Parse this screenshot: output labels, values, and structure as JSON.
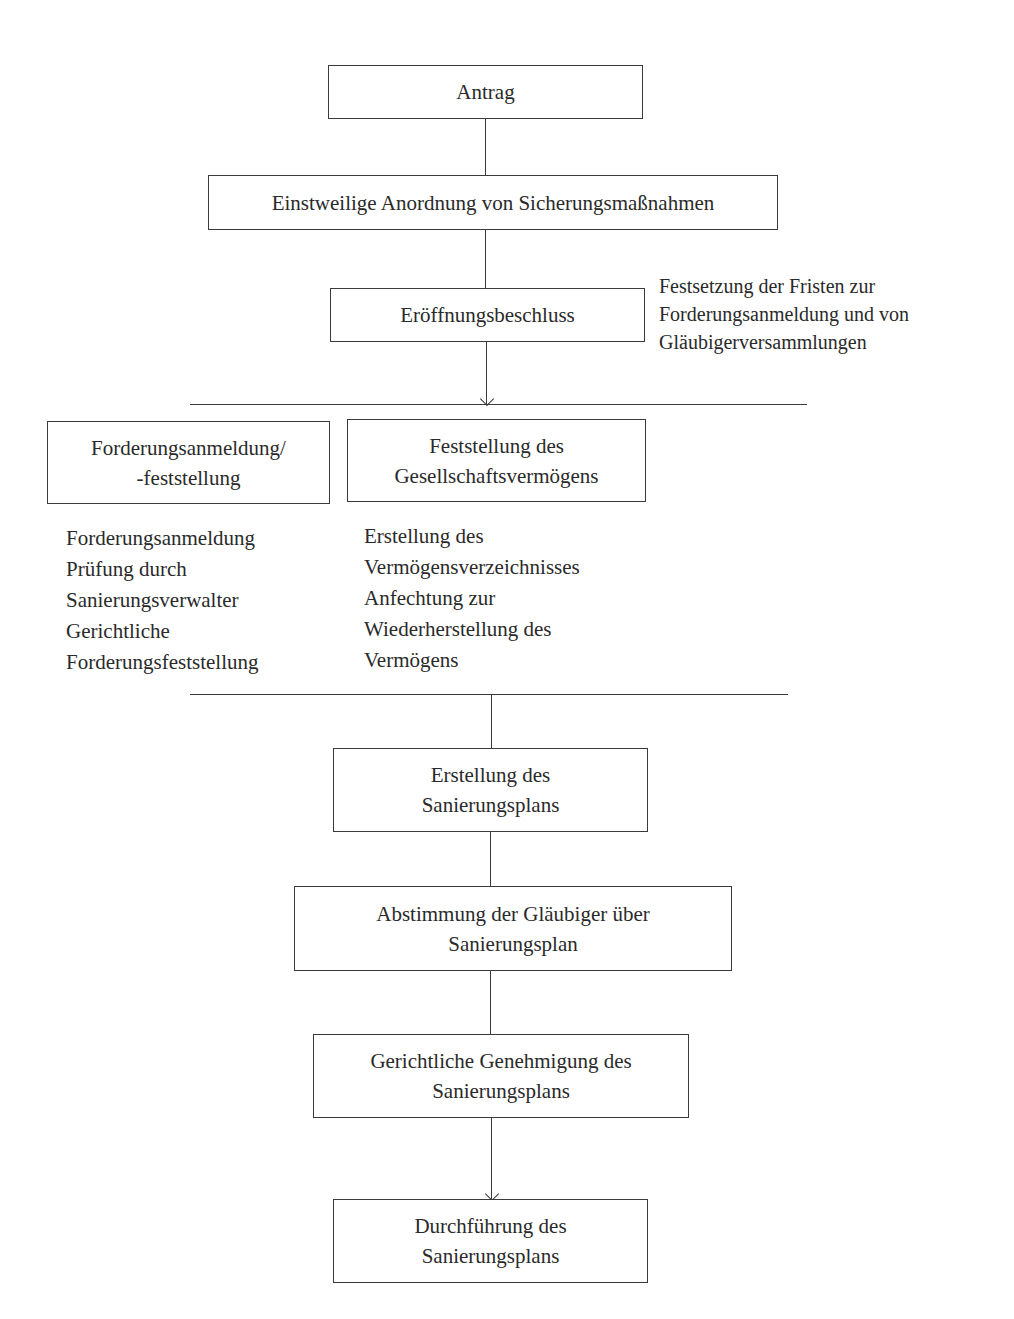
{
  "diagram": {
    "title": "",
    "steps": {
      "antrag": "Antrag",
      "sicherung": "Einstweilige Anordnung von Sicherungsmaßnahmen",
      "eroeffnung": "Eröffnungsbeschluss",
      "forderung_box": [
        "Forderungsanmeldung/",
        "-feststellung"
      ],
      "vermoegen_box": [
        "Feststellung des",
        "Gesellschaftsvermögens"
      ],
      "erstellung": [
        "Erstellung des",
        "Sanierungsplans"
      ],
      "abstimmung": [
        "Abstimmung der Gläubiger über",
        "Sanierungsplan"
      ],
      "genehmigung": [
        "Gerichtliche Genehmigung des",
        "Sanierungsplans"
      ],
      "durchfuehrung": [
        "Durchführung des",
        "Sanierungsplans"
      ]
    },
    "side_note": [
      "Festsetzung der Fristen zur",
      "Forderungsanmeldung und von",
      "Gläubigerversammlungen"
    ],
    "forderung_details": [
      "Forderungsanmeldung",
      "Prüfung durch",
      "Sanierungsverwalter",
      "Gerichtliche",
      "Forderungsfeststellung"
    ],
    "vermoegen_details": [
      "Erstellung des",
      "Vermögensverzeichnisses",
      "Anfechtung zur",
      "Wiederherstellung des",
      "Vermögens"
    ]
  }
}
